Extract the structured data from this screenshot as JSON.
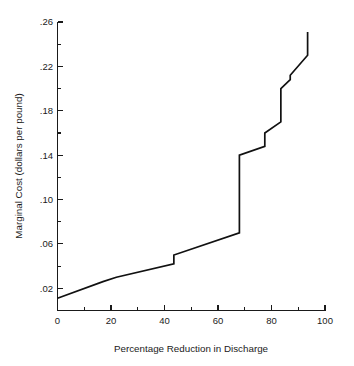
{
  "chart_data": {
    "type": "line",
    "title": "",
    "subtitle": "",
    "xlabel": "Percentage Reduction in Discharge",
    "ylabel": "Marginal Cost (dollars per pound)",
    "xlim": [
      0,
      100
    ],
    "ylim": [
      0,
      0.26
    ],
    "grid": false,
    "legend": null,
    "x_ticks_major": [
      0,
      20,
      40,
      60,
      80,
      100
    ],
    "x_tick_labels": [
      "0",
      "20",
      "40",
      "60",
      "80",
      "100"
    ],
    "x_ticks_minor": [
      10,
      30,
      50,
      70,
      90
    ],
    "y_ticks_major": [
      0.02,
      0.06,
      0.1,
      0.14,
      0.18,
      0.22,
      0.26
    ],
    "y_tick_labels": [
      ".02",
      ".06",
      ".10",
      ".14",
      ".18",
      ".22",
      ".26"
    ],
    "y_ticks_minor": [
      0.04,
      0.08,
      0.12,
      0.16,
      0.2,
      0.24
    ],
    "line_color": "#111111",
    "series": [
      {
        "name": "Marginal abatement cost",
        "x": [
          0,
          17,
          22,
          43.5,
          43.5,
          68,
          68,
          77.5,
          77.5,
          83.5,
          83.5,
          87,
          87,
          93.5,
          93.5
        ],
        "y": [
          0.011,
          0.026,
          0.03,
          0.042,
          0.05,
          0.07,
          0.14,
          0.148,
          0.16,
          0.17,
          0.2,
          0.208,
          0.212,
          0.23,
          0.251
        ],
        "points": [
          {
            "x": 0,
            "y": 0.011
          },
          {
            "x": 17,
            "y": 0.026
          },
          {
            "x": 22,
            "y": 0.03
          },
          {
            "x": 43.5,
            "y": 0.042
          },
          {
            "x": 43.5,
            "y": 0.05
          },
          {
            "x": 68,
            "y": 0.07
          },
          {
            "x": 68,
            "y": 0.14
          },
          {
            "x": 77.5,
            "y": 0.148
          },
          {
            "x": 77.5,
            "y": 0.16
          },
          {
            "x": 83.5,
            "y": 0.17
          },
          {
            "x": 83.5,
            "y": 0.2
          },
          {
            "x": 87,
            "y": 0.208
          },
          {
            "x": 87,
            "y": 0.212
          },
          {
            "x": 93.5,
            "y": 0.23
          },
          {
            "x": 93.5,
            "y": 0.251
          }
        ]
      }
    ]
  },
  "axes": {
    "x_title": "Percentage Reduction in Discharge",
    "y_title": "Marginal Cost (dollars per pound)"
  }
}
